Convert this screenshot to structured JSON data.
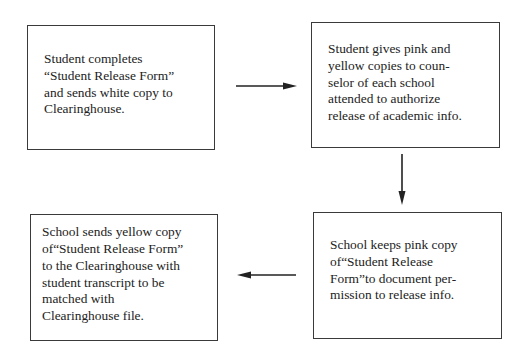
{
  "diagram": {
    "type": "flowchart",
    "steps": [
      {
        "id": "step1",
        "text": "Student completes\n“Student Release Form”\nand sends white copy to\nClearinghouse."
      },
      {
        "id": "step2",
        "text": "Student gives pink and\nyellow copies to coun-\nselor of each school\nattended to authorize\nrelease of academic info."
      },
      {
        "id": "step3",
        "text": "School keeps pink copy\nof“Student Release\nForm”to document per-\nmission to release info."
      },
      {
        "id": "step4",
        "text": "School sends yellow copy\nof“Student Release Form”\nto the Clearinghouse with\nstudent transcript to be\nmatched with\nClearinghouse file."
      }
    ],
    "connections": [
      {
        "from": "step1",
        "to": "step2",
        "direction": "right"
      },
      {
        "from": "step2",
        "to": "step3",
        "direction": "down"
      },
      {
        "from": "step3",
        "to": "step4",
        "direction": "left"
      }
    ],
    "colors": {
      "line": "#222222",
      "border": "#3a3a3a",
      "background": "#ffffff"
    }
  }
}
